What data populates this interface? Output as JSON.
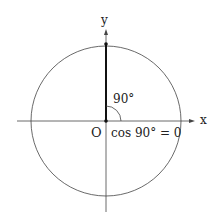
{
  "diagram": {
    "labels": {
      "x_axis": "x",
      "y_axis": "y",
      "origin": "O",
      "angle": "90°",
      "equation": "cos 90° = 0"
    },
    "colors": {
      "stroke": "#333333",
      "background": "#ffffff"
    }
  }
}
